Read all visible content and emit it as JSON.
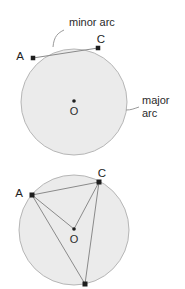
{
  "figure": {
    "title": "",
    "background_color": "#ffffff",
    "circle_fill": "#ebebeb",
    "circle_stroke": "#b6b6b6",
    "line_color": "#8a8a8a",
    "point_color": "#1e1e1e",
    "text_color": "#2b2b2b",
    "leader_color": "#9a9a9a"
  },
  "annotations": {
    "minor_arc_label": "minor arc",
    "major_arc_label_line1": "major",
    "major_arc_label_line2": "arc"
  },
  "top_circle": {
    "center": {
      "x": 74,
      "y": 102
    },
    "radius": 53,
    "points": [
      {
        "id": "A",
        "label": "A",
        "x": 33,
        "y": 58,
        "label_x": 20,
        "label_y": 60
      },
      {
        "id": "C",
        "label": "C",
        "x": 98,
        "y": 48,
        "label_x": 101,
        "label_y": 43
      },
      {
        "id": "O",
        "label": "O",
        "x": 74,
        "y": 101,
        "label_x": 74,
        "label_y": 115
      }
    ],
    "chords": [
      {
        "from": "A",
        "to": "C"
      }
    ]
  },
  "bottom_circle": {
    "center": {
      "x": 74,
      "y": 230
    },
    "radius": 55,
    "points": [
      {
        "id": "A",
        "label": "A",
        "x": 32,
        "y": 195,
        "label_x": 19,
        "label_y": 197
      },
      {
        "id": "C",
        "label": "C",
        "x": 99,
        "y": 182,
        "label_x": 102,
        "label_y": 177
      },
      {
        "id": "O",
        "label": "O",
        "x": 74,
        "y": 229,
        "label_x": 74,
        "label_y": 243
      },
      {
        "id": "B",
        "label": "",
        "x": 85,
        "y": 284,
        "label_x": 0,
        "label_y": 0
      }
    ],
    "segments": [
      {
        "from": "A",
        "to": "C"
      },
      {
        "from": "A",
        "to": "O"
      },
      {
        "from": "C",
        "to": "O"
      },
      {
        "from": "A",
        "to": "B"
      },
      {
        "from": "C",
        "to": "B"
      }
    ]
  },
  "leaders": {
    "minor_arc": {
      "text_x": 66,
      "text_y": 26,
      "path": "M 64 30 C 58 33, 54 36, 53 47"
    },
    "major_arc": {
      "text_x": 142,
      "text_y": 102,
      "path": "M 139 107 C 133 109, 131 110, 126 110"
    }
  }
}
